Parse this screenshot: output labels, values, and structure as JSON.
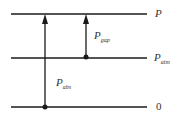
{
  "diagram": {
    "levels": [
      {
        "id": "P",
        "label": "P",
        "sub": ""
      },
      {
        "id": "P_atm",
        "label": "P",
        "sub": "atm"
      },
      {
        "id": "zero",
        "label": "0",
        "sub": ""
      }
    ],
    "arrows": [
      {
        "id": "P_gap",
        "label": "P",
        "sub": "gap",
        "from": "P_atm",
        "to": "P"
      },
      {
        "id": "P_abs",
        "label": "P",
        "sub": "abs",
        "from": "zero",
        "to": "P"
      }
    ],
    "colors": {
      "line": "#1a1a1a",
      "text": "#333333"
    }
  }
}
